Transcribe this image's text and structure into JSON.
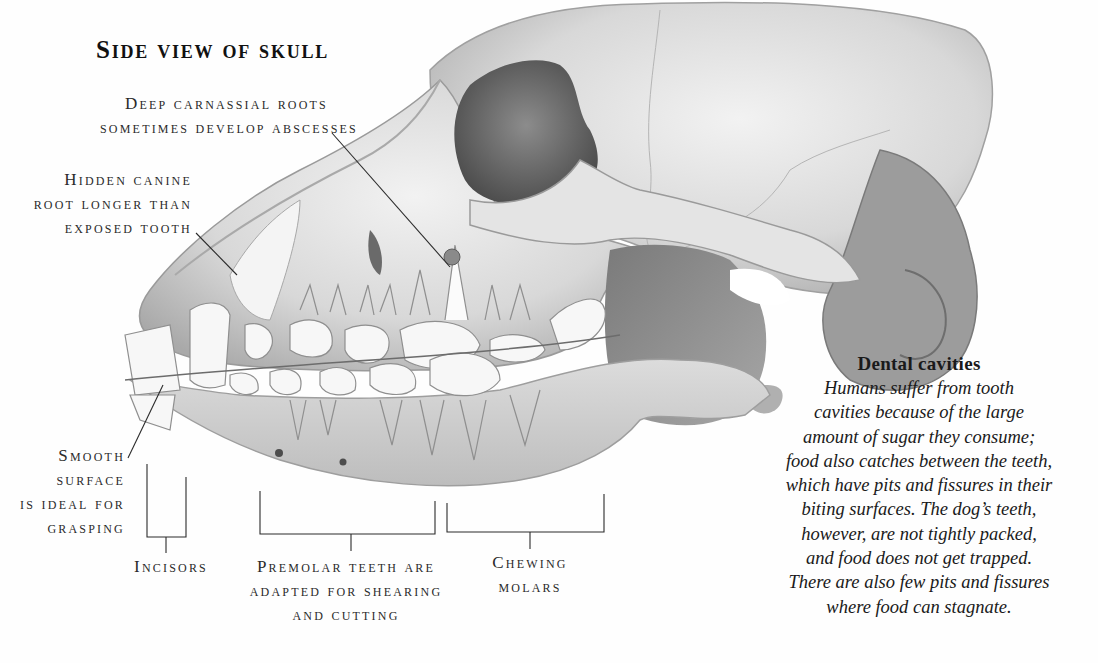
{
  "title": "Side view of skull",
  "labels": {
    "carnassial": [
      "Deep carnassial roots",
      "sometimes develop abscesses"
    ],
    "canine": [
      "Hidden canine",
      "root longer than",
      "exposed tooth"
    ],
    "smooth": [
      "Smooth",
      "surface",
      "is ideal for",
      "grasping"
    ],
    "incisors": [
      "Incisors"
    ],
    "premolar": [
      "Premolar teeth are",
      "adapted for shearing",
      "and cutting"
    ],
    "molars": [
      "Chewing",
      "molars"
    ]
  },
  "sidebar": {
    "heading": "Dental cavities",
    "lines": [
      "Humans  suffer from tooth",
      "cavities because of the large",
      "amount of sugar they consume;",
      "food also catches between the teeth,",
      "which have pits and fissures in their",
      "biting surfaces. The dog’s teeth,",
      "however, are not tightly packed,",
      "and food does not get trapped.",
      "There are also few pits and fissures",
      "where food can stagnate."
    ]
  },
  "colors": {
    "ink": "#2a2a2a",
    "bone_light": "#e9e9e9",
    "bone_mid": "#c8c8c8",
    "bone_dark": "#8a8a8a",
    "shadow": "#5e5e5e",
    "abscess": "#7a7a7a"
  }
}
